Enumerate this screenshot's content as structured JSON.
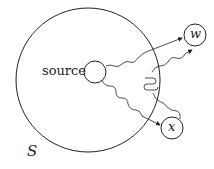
{
  "diagram": {
    "labels": {
      "source": "source",
      "set": "S",
      "w": "w",
      "x": "x"
    },
    "nodes": [
      "source",
      "w",
      "x"
    ],
    "region": "S",
    "edges": [
      {
        "from": "source",
        "to": "w",
        "style": "wavy-then-arrow"
      },
      {
        "from": "source",
        "to": "x",
        "style": "wavy-then-arrow"
      },
      {
        "from": "S-boundary",
        "to": "w",
        "style": "wavy-arrow"
      },
      {
        "from": "x",
        "to": "S-boundary",
        "style": "wavy-loop"
      }
    ],
    "colors": {
      "stroke": "#222222",
      "background": "#ffffff"
    }
  }
}
